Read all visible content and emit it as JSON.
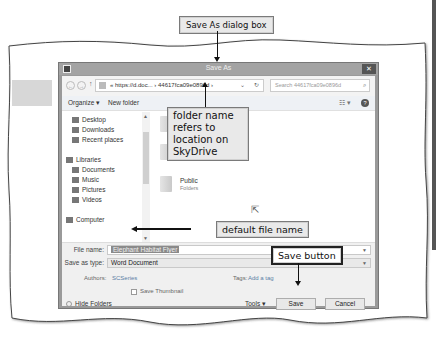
{
  "callouts": {
    "dialog": "Save As dialog box",
    "folder": "folder name refers to location on SkyDrive",
    "filename": "default file name",
    "save": "Save button"
  },
  "dialog": {
    "title": "Save As",
    "close_glyph": "✕",
    "address": {
      "back_glyph": "←",
      "forward_glyph": "→",
      "up_glyph": "↑",
      "path": "« https://d.doc... › 44617fca09e0896d ›",
      "dropdown_glyph": "⌄",
      "refresh_glyph": "↻"
    },
    "search": {
      "placeholder": "Search 44617fca09e0896d",
      "icon_glyph": "⌕"
    },
    "toolbar": {
      "organize": "Organize ▾",
      "new_folder": "New folder",
      "view_glyph": "☷ ▾",
      "help_glyph": "?"
    },
    "nav": [
      {
        "label": "Desktop"
      },
      {
        "label": "Downloads"
      },
      {
        "label": "Recent places"
      },
      {
        "label": "Libraries"
      },
      {
        "label": "Documents"
      },
      {
        "label": "Music"
      },
      {
        "label": "Pictures"
      },
      {
        "label": "Videos"
      },
      {
        "label": "Computer"
      }
    ],
    "folders": [
      {
        "name": "Documents",
        "sub": ""
      },
      {
        "name": "Public",
        "sub": "Folders"
      }
    ],
    "form": {
      "file_name_label": "File name:",
      "file_name_value": "Elephant Habitat Flyer",
      "save_type_label": "Save as type:",
      "save_type_value": "Word Document",
      "authors_label": "Authors:",
      "authors_value": "SCSeries",
      "tags_label": "Tags:",
      "tags_value": "Add a tag",
      "thumbnail_label": "Save Thumbnail"
    },
    "bottom": {
      "hide_folders": "Hide Folders",
      "tools": "Tools ▾",
      "save": "Save",
      "cancel": "Cancel"
    }
  }
}
